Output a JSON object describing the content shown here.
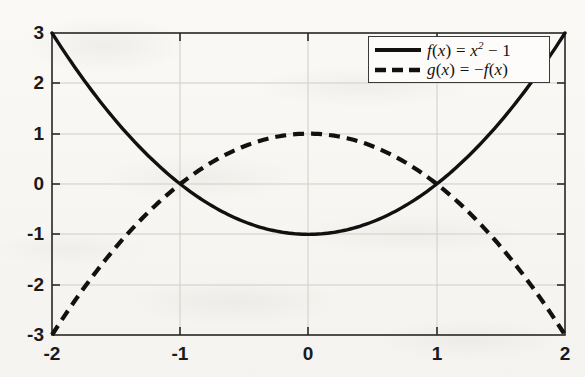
{
  "chart_data": {
    "type": "line",
    "title": "",
    "xlabel": "",
    "ylabel": "",
    "xlim": [
      -2,
      2
    ],
    "ylim": [
      -3,
      3
    ],
    "xticks": [
      "-2",
      "-1",
      "0",
      "1",
      "2"
    ],
    "xtick_values": [
      -2,
      -1,
      0,
      1,
      2
    ],
    "yticks": [
      "3",
      "2",
      "1",
      "0",
      "-1",
      "-2",
      "-3"
    ],
    "ytick_values": [
      3,
      2,
      1,
      0,
      -1,
      -2,
      -3
    ],
    "grid": true,
    "legend_position": "upper right",
    "series": [
      {
        "name": "f(x) = x^2 - 1",
        "label_plain": "f(x) = x² − 1",
        "style": "solid",
        "color": "#111111",
        "x": [
          -2,
          -1.8,
          -1.6,
          -1.4,
          -1.2,
          -1,
          -0.8,
          -0.6,
          -0.4,
          -0.2,
          0,
          0.2,
          0.4,
          0.6,
          0.8,
          1,
          1.2,
          1.4,
          1.6,
          1.8,
          2
        ],
        "values": [
          3,
          2.24,
          1.56,
          0.96,
          0.44,
          0,
          -0.36,
          -0.64,
          -0.84,
          -0.96,
          -1,
          -0.96,
          -0.84,
          -0.64,
          -0.36,
          0,
          0.44,
          0.96,
          1.56,
          2.24,
          3
        ]
      },
      {
        "name": "g(x) = -f(x)",
        "label_plain": "g(x) = −f(x)",
        "style": "dashed",
        "color": "#111111",
        "x": [
          -2,
          -1.8,
          -1.6,
          -1.4,
          -1.2,
          -1,
          -0.8,
          -0.6,
          -0.4,
          -0.2,
          0,
          0.2,
          0.4,
          0.6,
          0.8,
          1,
          1.2,
          1.4,
          1.6,
          1.8,
          2
        ],
        "values": [
          -3,
          -2.24,
          -1.56,
          -0.96,
          -0.44,
          0,
          0.36,
          0.64,
          0.84,
          0.96,
          1,
          0.96,
          0.84,
          0.64,
          0.36,
          0,
          -0.44,
          -0.96,
          -1.56,
          -2.24,
          -3
        ]
      }
    ],
    "annotations": []
  },
  "axes": {
    "x_tick_labels": [
      "-2",
      "-1",
      "0",
      "1",
      "2"
    ],
    "y_tick_labels": [
      "3",
      "2",
      "1",
      "0",
      "-1",
      "-2",
      "-3"
    ]
  },
  "legend": {
    "entries": [
      {
        "sample": "solid-line-sample",
        "fn": "f",
        "arg": "x",
        "eq": " = ",
        "body": "x",
        "exp": "2",
        "tail": " − 1"
      },
      {
        "sample": "dashed-line-sample",
        "fn": "g",
        "arg": "x",
        "eq": " = ",
        "neg": "−",
        "fn2": "f",
        "arg2": "x"
      }
    ]
  }
}
